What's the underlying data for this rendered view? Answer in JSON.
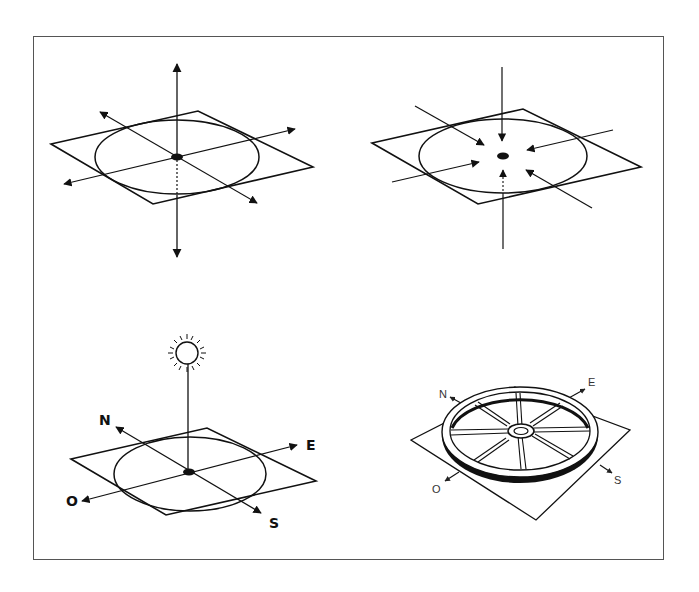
{
  "figure": {
    "panels": [
      {
        "id": "radiating-axes",
        "description": "Plane with circle; arrows radiating outward from central point in all directions"
      },
      {
        "id": "converging-axes",
        "description": "Plane with circle; arrows converging toward central point from all directions"
      },
      {
        "id": "sun-cardinal",
        "description": "Sun above central point on plane with cardinal directions",
        "labels": {
          "north": "N",
          "east": "E",
          "south": "S",
          "west": "O"
        }
      },
      {
        "id": "wheel-cardinal",
        "description": "Spoked wheel lying on plane with cardinal direction arrows",
        "labels": {
          "north": "N",
          "east": "E",
          "south": "S",
          "west": "O"
        }
      }
    ]
  },
  "colors": {
    "stroke": "#111111",
    "frame": "#555555",
    "background": "#ffffff"
  }
}
